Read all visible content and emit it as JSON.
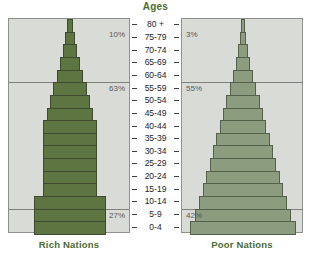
{
  "chart_data": {
    "type": "bar",
    "title": "Ages",
    "subtitle": "",
    "xlabel": "",
    "ylabel": "Ages",
    "orientation": "horizontal",
    "layout": "population-pyramid-pair",
    "grid": true,
    "legend_position": "none",
    "categories": [
      "80 +",
      "75-79",
      "70-74",
      "65-69",
      "60-64",
      "55-59",
      "50-54",
      "45-49",
      "40-44",
      "35-39",
      "30-34",
      "25-29",
      "20-24",
      "15-19",
      "10-14",
      "5-9",
      "0-4"
    ],
    "series": [
      {
        "name": "Rich Nations",
        "color": "#5d7540",
        "values": [
          7,
          11,
          16,
          22,
          29,
          36,
          44,
          51,
          58,
          58,
          58,
          58,
          58,
          58,
          78,
          78,
          78
        ]
      },
      {
        "name": "Poor Nations",
        "color": "#8b9c7f",
        "values": [
          4,
          7,
          11,
          16,
          22,
          29,
          36,
          44,
          51,
          58,
          65,
          72,
          80,
          88,
          96,
          104,
          115
        ]
      }
    ],
    "annotations": [
      {
        "panel": "Rich Nations",
        "label": "10%",
        "group": "ages 60-64 and older"
      },
      {
        "panel": "Rich Nations",
        "label": "63%",
        "group": "ages 15-59"
      },
      {
        "panel": "Rich Nations",
        "label": "27%",
        "group": "ages 0-14"
      },
      {
        "panel": "Poor Nations",
        "label": "3%",
        "group": "ages 60-64 and older"
      },
      {
        "panel": "Poor Nations",
        "label": "55%",
        "group": "ages 15-59"
      },
      {
        "panel": "Poor Nations",
        "label": "42%",
        "group": "ages 0-14"
      }
    ]
  },
  "header": {
    "ages_title": "Ages"
  },
  "panels": {
    "rich": {
      "caption": "Rich Nations",
      "percents": {
        "top": "10%",
        "middle": "63%",
        "bottom": "27%"
      }
    },
    "poor": {
      "caption": "Poor Nations",
      "percents": {
        "top": "3%",
        "middle": "55%",
        "bottom": "42%"
      }
    }
  },
  "age_labels": [
    "80 +",
    "75-79",
    "70-74",
    "65-69",
    "60-64",
    "55-59",
    "50-54",
    "45-49",
    "40-44",
    "35-39",
    "30-34",
    "25-29",
    "20-24",
    "15-19",
    "10-14",
    "5-9",
    "0-4"
  ],
  "colors": {
    "rich_bar": "#5d7540",
    "poor_bar": "#8b9c7f",
    "panel_background": "#d9dbd7",
    "panel_border": "#8d908c",
    "gridline": "#7e817d",
    "caption_text": "#4a6b33",
    "percent_text": "#55585a",
    "age_text": "#22242a"
  }
}
